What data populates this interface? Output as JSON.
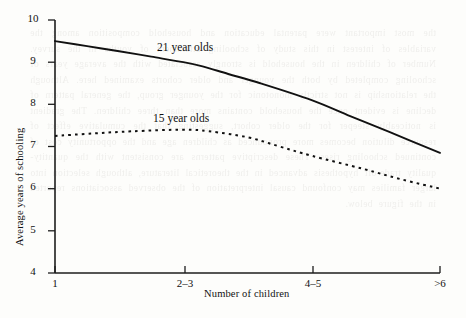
{
  "chart_data": {
    "type": "line",
    "title": "",
    "subtitle": "",
    "xlabel": "Number of children",
    "ylabel": "Average years of schooling",
    "categories": [
      "1",
      "2–3",
      "4–5",
      ">6"
    ],
    "x_tick_labels": [
      "1",
      "2–3",
      "4–5",
      ">6"
    ],
    "y_tick_labels": [
      "4",
      "5",
      "6",
      "7",
      "8",
      "9",
      "10"
    ],
    "y_ticks": [
      4,
      5,
      6,
      7,
      8,
      9,
      10
    ],
    "ylim": [
      4,
      10
    ],
    "xlim": [
      0,
      3
    ],
    "grid": false,
    "legend_position": "inline-annotations",
    "series": [
      {
        "name": "21 year olds",
        "label": "21 year olds",
        "style": "solid",
        "color": "#111111",
        "values": [
          9.5,
          9.0,
          8.1,
          6.85
        ],
        "curve_points": [
          [
            0.0,
            9.5
          ],
          [
            0.25,
            9.38
          ],
          [
            0.5,
            9.26
          ],
          [
            0.75,
            9.13
          ],
          [
            1.0,
            9.0
          ],
          [
            1.15,
            8.9
          ],
          [
            1.35,
            8.72
          ],
          [
            1.6,
            8.5
          ],
          [
            2.0,
            8.1
          ],
          [
            2.3,
            7.72
          ],
          [
            2.6,
            7.35
          ],
          [
            3.0,
            6.85
          ]
        ],
        "annotation": {
          "text": "21 year olds",
          "x_px": 157,
          "y_px": 47
        }
      },
      {
        "name": "15 year olds",
        "label": "15 year olds",
        "style": "dotted",
        "color": "#111111",
        "values": [
          7.25,
          7.4,
          6.7,
          6.0
        ],
        "curve_points": [
          [
            0.0,
            7.25
          ],
          [
            0.3,
            7.31
          ],
          [
            0.6,
            7.36
          ],
          [
            1.0,
            7.4
          ],
          [
            1.2,
            7.36
          ],
          [
            1.5,
            7.22
          ],
          [
            1.75,
            7.0
          ],
          [
            2.0,
            6.78
          ],
          [
            2.4,
            6.47
          ],
          [
            2.7,
            6.22
          ],
          [
            3.0,
            6.0
          ]
        ],
        "annotation": {
          "text": "15 year olds",
          "x_px": 153,
          "y_px": 119
        }
      }
    ]
  },
  "bleed_text": "the most important were parental education and household composition among the variables of interest in this study of schooling attainment of youths in the survey. Number of children in the household is strongly associated with the average years of schooling completed by both the younger and older cohorts examined here. Although the relationship is not strictly monotonic for the younger group, the general pattern of decline is evident once the household contains more than three children. The gradient is noticeably steeper for the older cohort, suggesting that the cumulative effect of resource dilution becomes more pronounced as children age and the opportunity cost of continued schooling rises. These descriptive patterns are consistent with the quantity-quality trade-off hypothesis advanced in the theoretical literature, although selection into larger families may confound causal interpretation of the observed associations reported in the figure below."
}
